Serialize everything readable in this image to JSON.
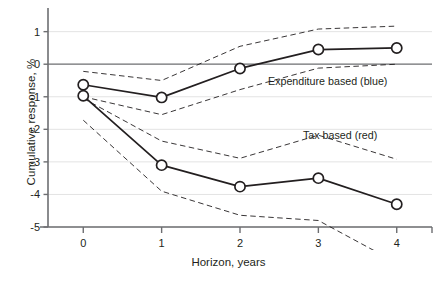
{
  "chart_data": {
    "type": "line",
    "title": "",
    "xlabel": "Horizon, years",
    "ylabel": "Cumulative response, %",
    "x": [
      0,
      1,
      2,
      3,
      4
    ],
    "xtick_labels": [
      "0",
      "1",
      "2",
      "3",
      "4"
    ],
    "ytick_labels": [
      "1",
      "0",
      "-1",
      "-2",
      "-3",
      "-4",
      "-5"
    ],
    "ytick_values": [
      1,
      0,
      -1,
      -2,
      -3,
      -4,
      -5
    ],
    "xlim": [
      -0.45,
      4.45
    ],
    "ylim": [
      -5,
      1.45
    ],
    "grid": "horizontal",
    "legend_position": "inline-annotation",
    "series": [
      {
        "name": "Expenditure based (blue)",
        "label": "Expenditure based (blue)",
        "color": "#231f20",
        "marker": "open-circle",
        "style": "solid",
        "values": [
          -0.63,
          -1.02,
          -0.13,
          0.45,
          0.5
        ],
        "band_upper": {
          "name": "Expenditure based upper confidence band",
          "style": "dashed",
          "values": [
            -0.22,
            -0.5,
            0.55,
            1.08,
            1.17
          ]
        },
        "band_lower": {
          "name": "Expenditure based lower confidence band",
          "style": "dashed",
          "values": [
            -1.0,
            -1.55,
            -0.78,
            -0.12,
            0.0
          ]
        }
      },
      {
        "name": "Tax based (red)",
        "label": "Tax based (red)",
        "color": "#231f20",
        "marker": "open-circle",
        "style": "solid",
        "values": [
          -0.97,
          -3.1,
          -3.76,
          -3.5,
          -4.3
        ],
        "band_upper": {
          "name": "Tax based upper confidence band",
          "style": "dashed",
          "values": [
            -1.05,
            -2.36,
            -2.89,
            -2.18,
            -2.92
          ]
        },
        "band_lower": {
          "name": "Tax based lower confidence band",
          "style": "dashed",
          "values": [
            -1.72,
            -3.9,
            -4.64,
            -4.8,
            -6.1
          ]
        }
      }
    ],
    "annotations": [
      {
        "name": "expenditure-label",
        "text": "Expenditure based (blue)",
        "x": 2.45,
        "y": -0.62
      },
      {
        "name": "tax-label",
        "text": "Tax based (red)",
        "x": 2.95,
        "y": -2.15
      }
    ],
    "axis_color": "#6d6e71",
    "gridline_color": "#e3e3e3",
    "zeroline_color": "#6d6e71"
  },
  "figure": {
    "caption": ""
  }
}
